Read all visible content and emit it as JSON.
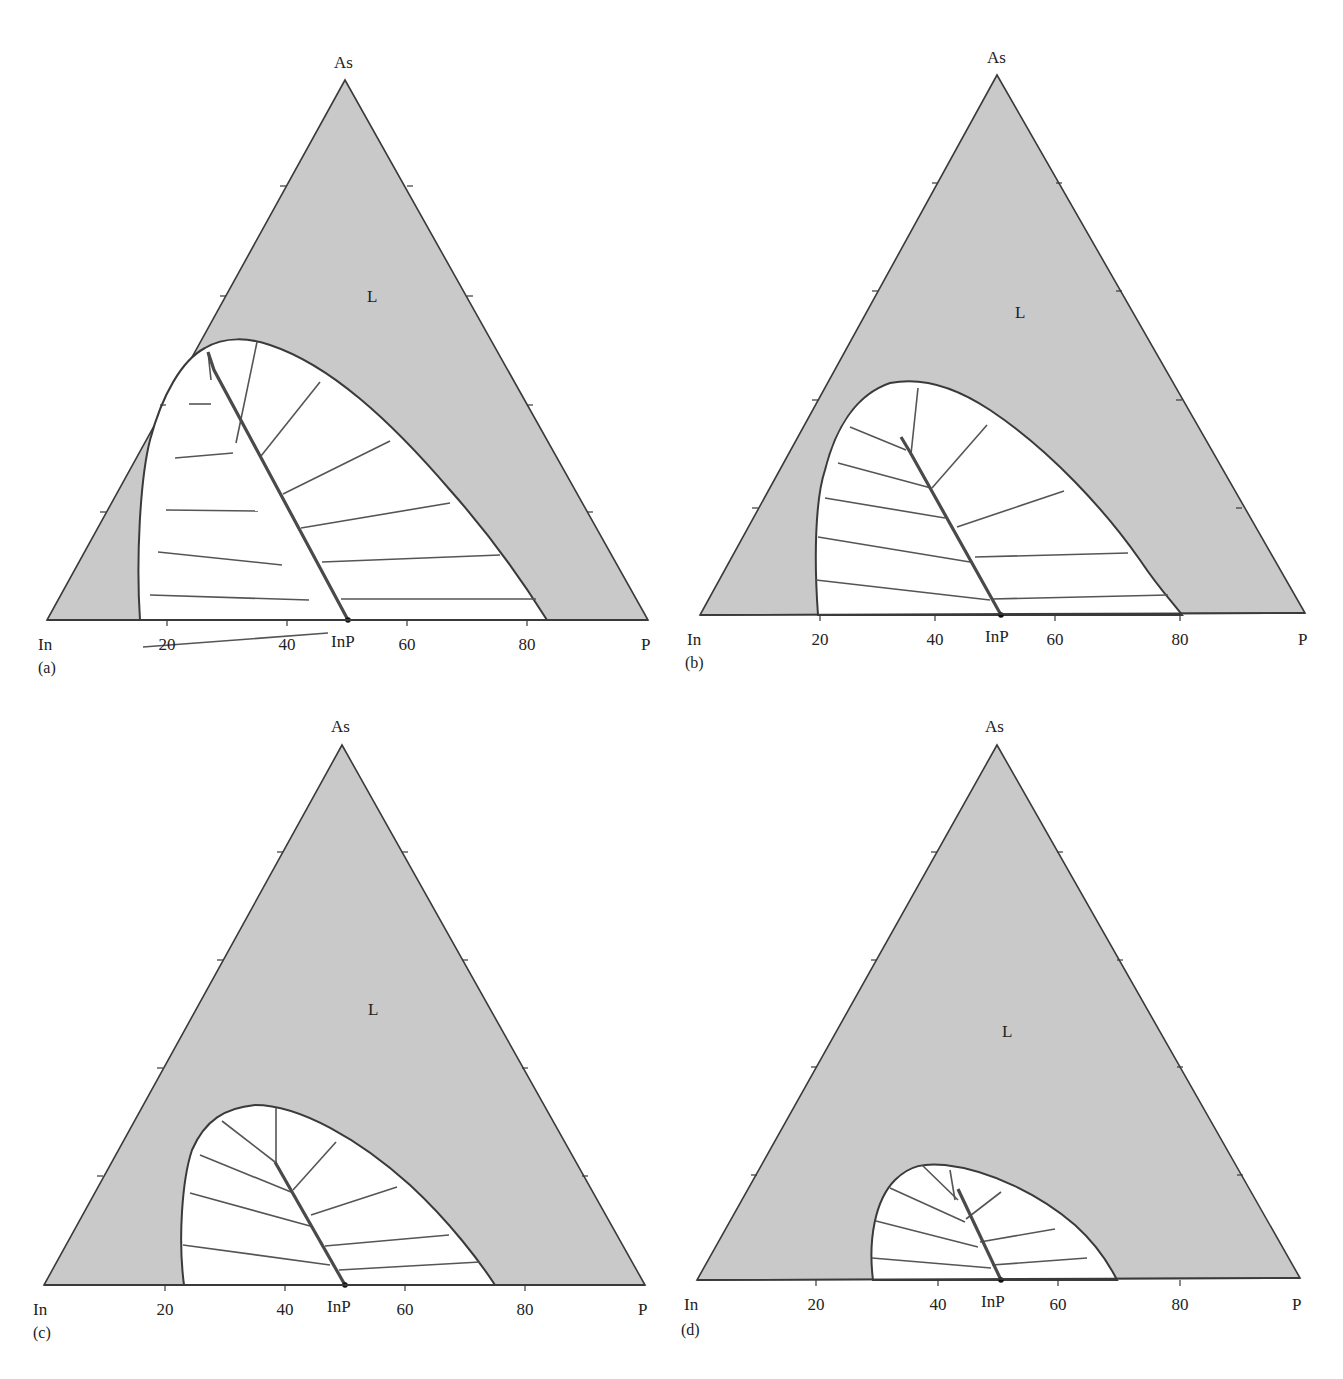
{
  "figure": {
    "colors": {
      "liquid_fill": "#c9c9c9",
      "outline": "#3a3a3a",
      "tie_line": "#555555",
      "solid_line": "#4a4a4a",
      "two_phase_fill": "#ffffff"
    },
    "vertex_labels": {
      "top": "As",
      "left": "In",
      "right": "P"
    },
    "region_label": "L",
    "compound_label": "InP",
    "tick_labels": [
      "20",
      "40",
      "60",
      "80"
    ]
  },
  "chart_data": [
    {
      "type": "ternary-phase-diagram",
      "panel": "(a)",
      "vertices": {
        "top": "As",
        "left": "In",
        "right": "P"
      },
      "bottom_axis_ticks": [
        20,
        40,
        60,
        80
      ],
      "regions": [
        "L (liquid, shaded)",
        "L + InAs1-xPx solid (two-phase, white, with tie lines)"
      ],
      "solid_solution_line": "InP (50 at.% P) to near InAs side",
      "liquidus_bottom_intercepts": [
        15,
        84
      ]
    },
    {
      "type": "ternary-phase-diagram",
      "panel": "(b)",
      "vertices": {
        "top": "As",
        "left": "In",
        "right": "P"
      },
      "bottom_axis_ticks": [
        20,
        40,
        60,
        80
      ],
      "liquidus_bottom_intercepts": [
        20,
        80
      ]
    },
    {
      "type": "ternary-phase-diagram",
      "panel": "(c)",
      "vertices": {
        "top": "As",
        "left": "In",
        "right": "P"
      },
      "bottom_axis_ticks": [
        20,
        40,
        60,
        80
      ],
      "liquidus_bottom_intercepts": [
        23,
        76
      ]
    },
    {
      "type": "ternary-phase-diagram",
      "panel": "(d)",
      "vertices": {
        "top": "As",
        "left": "In",
        "right": "P"
      },
      "bottom_axis_ticks": [
        20,
        40,
        60,
        80
      ],
      "liquidus_bottom_intercepts": [
        30,
        70
      ]
    }
  ],
  "panels": [
    {
      "id": "a",
      "label": "(a)",
      "tri": {
        "in": [
          47,
          620
        ],
        "p": [
          648,
          620
        ],
        "as": [
          345,
          80
        ]
      },
      "lbl_pos": {
        "as": [
          334,
          68
        ],
        "in": [
          38,
          650
        ],
        "p": [
          641,
          650
        ],
        "id": [
          38,
          673
        ],
        "L": [
          367,
          302
        ],
        "inp": [
          331,
          650
        ]
      },
      "ticks_x": [
        167,
        287,
        407,
        527
      ],
      "tick_lbl_y": 650,
      "left_ticks": [
        [
          286,
          186
        ],
        [
          226,
          296
        ],
        [
          166,
          405
        ],
        [
          106,
          512
        ]
      ],
      "right_ticks": [
        [
          407,
          186
        ],
        [
          467,
          296
        ],
        [
          527,
          405
        ],
        [
          587,
          512
        ]
      ],
      "loop": "M140,620 C136,560 140,480 150,440 C162,395 182,360 205,348 C225,336 250,338 270,345 C330,365 390,420 450,490 C490,535 525,585 547,620 Z",
      "solid": [
        [
          348,
          620
        ],
        [
          214,
          370
        ],
        [
          208,
          352
        ]
      ],
      "ties": [
        [
          [
            208,
            352
          ],
          [
            211,
            380
          ]
        ],
        [
          [
            189,
            404
          ],
          [
            211,
            404
          ]
        ],
        [
          [
            175,
            458
          ],
          [
            233,
            453
          ]
        ],
        [
          [
            257,
            342
          ],
          [
            236,
            443
          ]
        ],
        [
          [
            166,
            510
          ],
          [
            258,
            511
          ]
        ],
        [
          [
            320,
            382
          ],
          [
            261,
            456
          ]
        ],
        [
          [
            158,
            552
          ],
          [
            282,
            565
          ]
        ],
        [
          [
            390,
            441
          ],
          [
            283,
            494
          ]
        ],
        [
          [
            150,
            595
          ],
          [
            309,
            600
          ]
        ],
        [
          [
            450,
            503
          ],
          [
            301,
            528
          ]
        ],
        [
          [
            143,
            647
          ],
          [
            328,
            633
          ]
        ],
        [
          [
            500,
            555
          ],
          [
            322,
            562
          ]
        ],
        [
          [
            536,
            599
          ],
          [
            341,
            599
          ]
        ]
      ]
    },
    {
      "id": "b",
      "label": "(b)",
      "tri": {
        "in": [
          700,
          615
        ],
        "p": [
          1305,
          613
        ],
        "as": [
          997,
          75
        ]
      },
      "lbl_pos": {
        "as": [
          987,
          63
        ],
        "in": [
          687,
          645
        ],
        "p": [
          1298,
          645
        ],
        "id": [
          685,
          668
        ],
        "L": [
          1015,
          318
        ],
        "inp": [
          985,
          645
        ]
      },
      "ticks_x": [
        820,
        935,
        1055,
        1180
      ],
      "tick_lbl_y": 645,
      "left_ticks": [
        [
          938,
          183
        ],
        [
          878,
          291
        ],
        [
          818,
          400
        ],
        [
          758,
          508
        ]
      ],
      "right_ticks": [
        [
          1056,
          183
        ],
        [
          1116,
          291
        ],
        [
          1176,
          400
        ],
        [
          1236,
          508
        ]
      ],
      "loop": "M818,615 C814,560 815,500 825,470 C835,430 855,395 890,383 C925,376 960,390 990,410 C1050,450 1105,510 1140,560 C1160,590 1175,605 1182,615 Z",
      "solid": [
        [
          1001,
          615
        ],
        [
          910,
          452
        ],
        [
          901,
          437
        ]
      ],
      "ties": [
        [
          [
            850,
            427
          ],
          [
            906,
            450
          ]
        ],
        [
          [
            918,
            388
          ],
          [
            911,
            454
          ]
        ],
        [
          [
            838,
            463
          ],
          [
            931,
            488
          ]
        ],
        [
          [
            987,
            425
          ],
          [
            932,
            488
          ]
        ],
        [
          [
            825,
            498
          ],
          [
            945,
            518
          ]
        ],
        [
          [
            1064,
            491
          ],
          [
            957,
            527
          ]
        ],
        [
          [
            818,
            537
          ],
          [
            970,
            562
          ]
        ],
        [
          [
            1128,
            553
          ],
          [
            975,
            557
          ]
        ],
        [
          [
            816,
            580
          ],
          [
            990,
            600
          ]
        ],
        [
          [
            1168,
            595
          ],
          [
            992,
            599
          ]
        ]
      ]
    },
    {
      "id": "c",
      "label": "(c)",
      "tri": {
        "in": [
          44,
          1285
        ],
        "p": [
          645,
          1285
        ],
        "as": [
          342,
          745
        ]
      },
      "lbl_pos": {
        "as": [
          331,
          732
        ],
        "in": [
          33,
          1315
        ],
        "p": [
          638,
          1315
        ],
        "id": [
          33,
          1338
        ],
        "L": [
          368,
          1015
        ],
        "inp": [
          327,
          1315
        ]
      },
      "ticks_x": [
        165,
        285,
        405,
        525
      ],
      "tick_lbl_y": 1315,
      "left_ticks": [
        [
          283,
          852
        ],
        [
          223,
          960
        ],
        [
          163,
          1068
        ],
        [
          103,
          1176
        ]
      ],
      "right_ticks": [
        [
          402,
          852
        ],
        [
          462,
          960
        ],
        [
          522,
          1068
        ],
        [
          582,
          1176
        ]
      ],
      "loop": "M184,1285 C178,1240 182,1180 192,1150 C205,1120 225,1108 255,1105 C300,1105 360,1140 410,1185 C450,1222 480,1262 495,1285 Z",
      "solid": [
        [
          345,
          1285
        ],
        [
          275,
          1162
        ]
      ],
      "ties": [
        [
          [
            222,
            1121
          ],
          [
            275,
            1162
          ]
        ],
        [
          [
            276,
            1108
          ],
          [
            276,
            1162
          ]
        ],
        [
          [
            200,
            1155
          ],
          [
            291,
            1192
          ]
        ],
        [
          [
            336,
            1142
          ],
          [
            293,
            1190
          ]
        ],
        [
          [
            190,
            1193
          ],
          [
            310,
            1226
          ]
        ],
        [
          [
            397,
            1187
          ],
          [
            311,
            1215
          ]
        ],
        [
          [
            183,
            1245
          ],
          [
            330,
            1265
          ]
        ],
        [
          [
            449,
            1235
          ],
          [
            325,
            1246
          ]
        ],
        [
          [
            480,
            1262
          ],
          [
            339,
            1270
          ]
        ]
      ]
    },
    {
      "id": "d",
      "label": "(d)",
      "tri": {
        "in": [
          697,
          1280
        ],
        "p": [
          1300,
          1278
        ],
        "as": [
          997,
          745
        ]
      },
      "lbl_pos": {
        "as": [
          985,
          732
        ],
        "in": [
          684,
          1310
        ],
        "p": [
          1292,
          1310
        ],
        "id": [
          681,
          1335
        ],
        "L": [
          1002,
          1037
        ],
        "inp": [
          981,
          1310
        ]
      },
      "ticks_x": [
        816,
        938,
        1058,
        1180
      ],
      "tick_lbl_y": 1310,
      "left_ticks": [
        [
          937,
          852
        ],
        [
          877,
          960
        ],
        [
          817,
          1067
        ],
        [
          757,
          1175
        ]
      ],
      "right_ticks": [
        [
          1057,
          852
        ],
        [
          1117,
          960
        ],
        [
          1177,
          1067
        ],
        [
          1237,
          1175
        ]
      ],
      "loop": "M873,1280 C868,1240 875,1200 895,1180 C910,1165 925,1163 945,1165 C990,1170 1040,1195 1075,1225 C1095,1243 1108,1262 1117,1280 Z",
      "solid": [
        [
          1001,
          1280
        ],
        [
          958,
          1189
        ]
      ],
      "ties": [
        [
          [
            922,
            1165
          ],
          [
            958,
            1200
          ]
        ],
        [
          [
            950,
            1170
          ],
          [
            955,
            1200
          ]
        ],
        [
          [
            890,
            1188
          ],
          [
            965,
            1222
          ]
        ],
        [
          [
            1001,
            1192
          ],
          [
            966,
            1219
          ]
        ],
        [
          [
            876,
            1221
          ],
          [
            978,
            1247
          ]
        ],
        [
          [
            1055,
            1229
          ],
          [
            980,
            1242
          ]
        ],
        [
          [
            872,
            1258
          ],
          [
            991,
            1268
          ]
        ],
        [
          [
            1087,
            1258
          ],
          [
            992,
            1265
          ]
        ]
      ]
    }
  ]
}
